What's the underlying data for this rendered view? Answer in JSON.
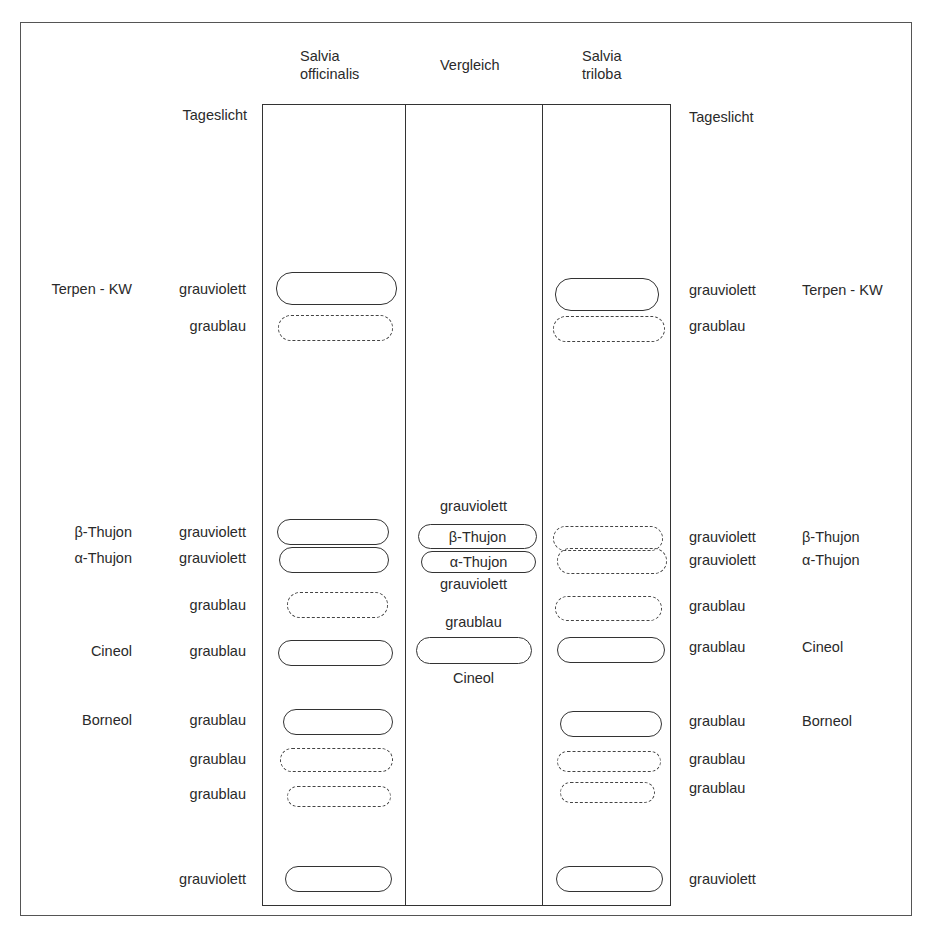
{
  "diagram": {
    "type": "thin-layer-chromatogram",
    "detection": "Tageslicht",
    "lanes": {
      "left": "Salvia\nofficinalis",
      "left_lines": [
        "Salvia",
        "officinalis"
      ],
      "middle": "Vergleich",
      "right_lines": [
        "Salvia",
        "triloba"
      ]
    },
    "detection_left": "Tageslicht",
    "detection_right": "Tageslicht",
    "left_substances": [
      "Terpen - KW",
      "β-Thujon",
      "α-Thujon",
      "Cineol",
      "Borneol"
    ],
    "left_colors": [
      "grauviolett",
      "graublau",
      "grauviolett",
      "grauviolett",
      "graublau",
      "graublau",
      "graublau",
      "graublau",
      "graublau",
      "grauviolett"
    ],
    "right_colors": [
      "grauviolett",
      "graublau",
      "grauviolett",
      "grauviolett",
      "graublau",
      "graublau",
      "graublau",
      "graublau",
      "graublau",
      "grauviolett"
    ],
    "right_substances": [
      "Terpen - KW",
      "β-Thujon",
      "α-Thujon",
      "Cineol",
      "Borneol"
    ],
    "reference": {
      "above": "grauviolett",
      "spot1": "β-Thujon",
      "spot2": "α-Thujon",
      "below": "grauviolett",
      "cineol_color": "graublau",
      "cineol_label": "Cineol"
    }
  }
}
